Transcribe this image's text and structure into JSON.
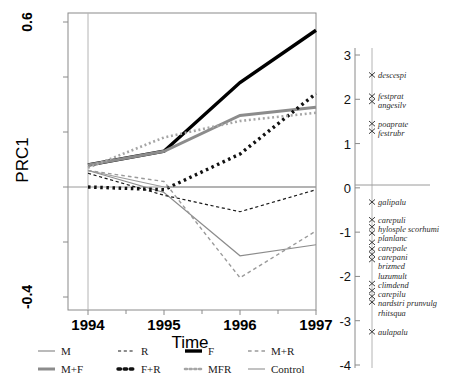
{
  "chart_data": {
    "type": "line",
    "title": "",
    "xlabel": "Time",
    "ylabel": "PRC1",
    "x": [
      1994,
      1995,
      1996,
      1997
    ],
    "xticklabels": [
      "1994",
      "1995",
      "1996",
      "1997"
    ],
    "ylim": [
      -0.4,
      0.6
    ],
    "yticklabels": [
      "0.6",
      "-0.4"
    ],
    "ytick_values": [
      0.6,
      -0.4
    ],
    "grid": false,
    "legend_position": "bottom",
    "zero_reference_line": 0,
    "series": [
      {
        "name": "M",
        "values": [
          0.06,
          -0.02,
          -0.25,
          -0.21
        ],
        "color": "#8c8c8c",
        "style": "solid",
        "width": 1.2
      },
      {
        "name": "R",
        "values": [
          0.05,
          -0.03,
          -0.09,
          -0.01
        ],
        "color": "#1a1a1a",
        "style": "dashed",
        "width": 1.2
      },
      {
        "name": "F",
        "values": [
          0.08,
          0.13,
          0.38,
          0.57
        ],
        "color": "#000000",
        "style": "solid",
        "width": 3.4
      },
      {
        "name": "M+R",
        "values": [
          0.06,
          0.02,
          -0.33,
          -0.16
        ],
        "color": "#9a9a9a",
        "style": "dashed",
        "width": 1.4
      },
      {
        "name": "M+F",
        "values": [
          0.08,
          0.13,
          0.26,
          0.29
        ],
        "color": "#8c8c8c",
        "style": "solid",
        "width": 3.0
      },
      {
        "name": "F+R",
        "values": [
          0.0,
          -0.01,
          0.12,
          0.34
        ],
        "color": "#111111",
        "style": "dotted",
        "width": 3.4
      },
      {
        "name": "MFR",
        "values": [
          0.07,
          0.18,
          0.24,
          0.27
        ],
        "color": "#a5a5a5",
        "style": "dotted",
        "width": 2.6
      },
      {
        "name": "Control",
        "values": [
          0.06,
          0.0,
          0.0,
          0.0
        ],
        "color": "#9a9a9a",
        "style": "solid",
        "width": 1.2
      }
    ],
    "species_axis": {
      "label": "",
      "ylim": [
        -4,
        3
      ],
      "ticklabels": [
        "3",
        "2",
        "1",
        "0",
        "-1",
        "-2",
        "-3",
        "-4"
      ],
      "tick_values": [
        3,
        2,
        1,
        0,
        -1,
        -2,
        -3,
        -4
      ],
      "species": [
        {
          "name": "descespi",
          "value": 2.55
        },
        {
          "name": "festprat",
          "value": 2.07
        },
        {
          "name": "angesilv",
          "value": 1.95
        },
        {
          "name": "poaprate",
          "value": 1.45
        },
        {
          "name": "festrubr",
          "value": 1.28
        },
        {
          "name": "galipalu",
          "value": -0.32
        },
        {
          "name": "carepuli",
          "value": -0.72
        },
        {
          "name": "hylosple scorhumi",
          "value": -0.88
        },
        {
          "name": "planlanc",
          "value": -1.02
        },
        {
          "name": "carepale",
          "value": -1.23
        },
        {
          "name": "carepani",
          "value": -1.38
        },
        {
          "name": "brizmed",
          "value": -1.5
        },
        {
          "name": "luzumult",
          "value": -1.62
        },
        {
          "name": "climdend",
          "value": -2.16
        },
        {
          "name": "carepilu",
          "value": -2.32
        },
        {
          "name": "nardstri prunvulg",
          "value": -2.45
        },
        {
          "name": "rhitsqua",
          "value": -2.58
        },
        {
          "name": "aulapalu",
          "value": -3.25
        }
      ]
    },
    "legend": [
      {
        "label": "M",
        "color": "#8c8c8c",
        "style": "solid",
        "width": 1.2
      },
      {
        "label": "R",
        "color": "#1a1a1a",
        "style": "dashed",
        "width": 1.2
      },
      {
        "label": "F",
        "color": "#000000",
        "style": "solid",
        "width": 3.4
      },
      {
        "label": "M+R",
        "color": "#9a9a9a",
        "style": "dashed",
        "width": 1.4
      },
      {
        "label": "M+F",
        "color": "#8c8c8c",
        "style": "solid",
        "width": 3.0
      },
      {
        "label": "F+R",
        "color": "#111111",
        "style": "dotted",
        "width": 3.4
      },
      {
        "label": "MFR",
        "color": "#a5a5a5",
        "style": "dotted",
        "width": 2.6
      },
      {
        "label": "Control",
        "color": "#9a9a9a",
        "style": "solid",
        "width": 1.2
      }
    ]
  }
}
